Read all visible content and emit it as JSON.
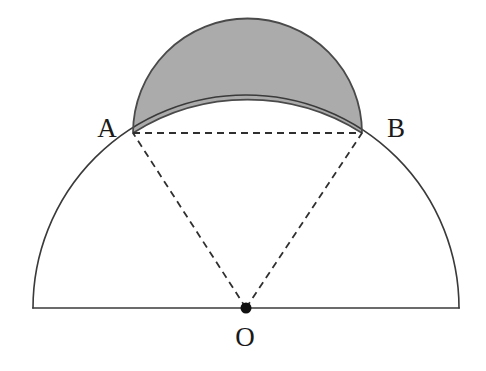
{
  "figure": {
    "background_color": "#ffffff",
    "stroke_color": "#3a3a3a",
    "shade_color": "#ababab",
    "shade_stroke_color": "#4a4a4a",
    "dash_color": "#2f2f2f",
    "point_color": "#111111",
    "labels": {
      "a": "A",
      "b": "B",
      "o": "O"
    },
    "label_positions": {
      "a": {
        "x": 107,
        "y": 128
      },
      "b": {
        "x": 396,
        "y": 128
      },
      "o": {
        "x": 245,
        "y": 337
      }
    },
    "points": {
      "center_o": {
        "x": 246,
        "y": 308
      },
      "point_a": {
        "x": 133,
        "y": 133
      },
      "point_b": {
        "x": 362,
        "y": 133
      },
      "baseline_left": {
        "x": 33,
        "y": 308
      },
      "baseline_right": {
        "x": 459,
        "y": 308
      },
      "big_arc_apex": {
        "x": 246,
        "y": 95
      },
      "lune_apex": {
        "x": 247,
        "y": 25
      }
    },
    "measurements": {
      "big_radius": 213,
      "chord_half_length": 114.5,
      "small_radius": 108,
      "chord_length": 229
    },
    "stroke_widths": {
      "arc": 1.6,
      "baseline": 1.6,
      "dash": 1.8,
      "lune_outline": 1.8
    },
    "dash_pattern": "7 5",
    "dot_radius": 5.5,
    "elements": [
      "big-semicircle-arc",
      "baseline-diameter",
      "chord-ab-dashed",
      "radius-oa-dashed",
      "radius-ob-dashed",
      "shaded-lune",
      "center-point-o"
    ]
  },
  "chart_data": {
    "type": "diagram",
    "shapes": [
      {
        "name": "large-semicircle",
        "kind": "semicircle",
        "center": [
          246,
          308
        ],
        "radius": 213,
        "orientation": "upper",
        "filled": false
      },
      {
        "name": "small-semicircle-on-ab",
        "kind": "semicircle",
        "center": [
          247.5,
          133
        ],
        "radius": 114.5,
        "orientation": "upper",
        "filled": true,
        "fill": "#ababab"
      },
      {
        "name": "chord-ab",
        "kind": "segment",
        "from": [
          133,
          133
        ],
        "to": [
          362,
          133
        ],
        "style": "dashed"
      },
      {
        "name": "radius-oa",
        "kind": "segment",
        "from": [
          246,
          308
        ],
        "to": [
          133,
          133
        ],
        "style": "dashed"
      },
      {
        "name": "radius-ob",
        "kind": "segment",
        "from": [
          246,
          308
        ],
        "to": [
          362,
          133
        ],
        "style": "dashed"
      }
    ],
    "labeled_points": [
      {
        "label": "A",
        "x": 133,
        "y": 133
      },
      {
        "label": "B",
        "x": 362,
        "y": 133
      },
      {
        "label": "O",
        "x": 246,
        "y": 308
      }
    ]
  }
}
